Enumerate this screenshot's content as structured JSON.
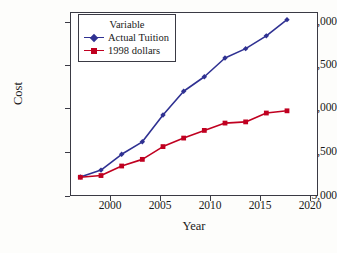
{
  "chart_data": {
    "type": "line",
    "title": "",
    "xlabel": "Year",
    "ylabel": "Cost",
    "xlim": [
      1997.0,
      2021.0
    ],
    "ylim": [
      5000,
      15800
    ],
    "xticks": [
      2000,
      2005,
      2010,
      2015,
      2020
    ],
    "xtick_labels": [
      "2000",
      "2005",
      "2010",
      "2015",
      "2020"
    ],
    "yticks": [
      5000,
      7500,
      10000,
      12500,
      15000
    ],
    "ytick_labels": [
      "5,000",
      "7,500",
      "10,000",
      "12,500",
      "15,000"
    ],
    "grid": false,
    "legend_position": "top-left",
    "legend_title": "Variable",
    "x": [
      1998,
      2000,
      2002,
      2004,
      2006,
      2008,
      2010,
      2012,
      2014,
      2016,
      2018
    ],
    "series": [
      {
        "name": "Actual Tuition",
        "color": "#2f3192",
        "marker": "diamond",
        "values": [
          6120,
          6520,
          7450,
          8180,
          9750,
          11150,
          12000,
          13100,
          13650,
          14400,
          15350
        ]
      },
      {
        "name": "1998 dollars",
        "color": "#c00020",
        "marker": "square",
        "values": [
          6100,
          6200,
          6760,
          7150,
          7900,
          8400,
          8850,
          9280,
          9350,
          9870,
          10000
        ]
      }
    ]
  },
  "axis": {
    "ylabel": "Cost",
    "xlabel": "Year"
  },
  "legend": {
    "title": "Variable",
    "items": [
      {
        "label": "Actual Tuition",
        "color": "#2f3192"
      },
      {
        "label": "1998 dollars",
        "color": "#c00020"
      }
    ]
  }
}
